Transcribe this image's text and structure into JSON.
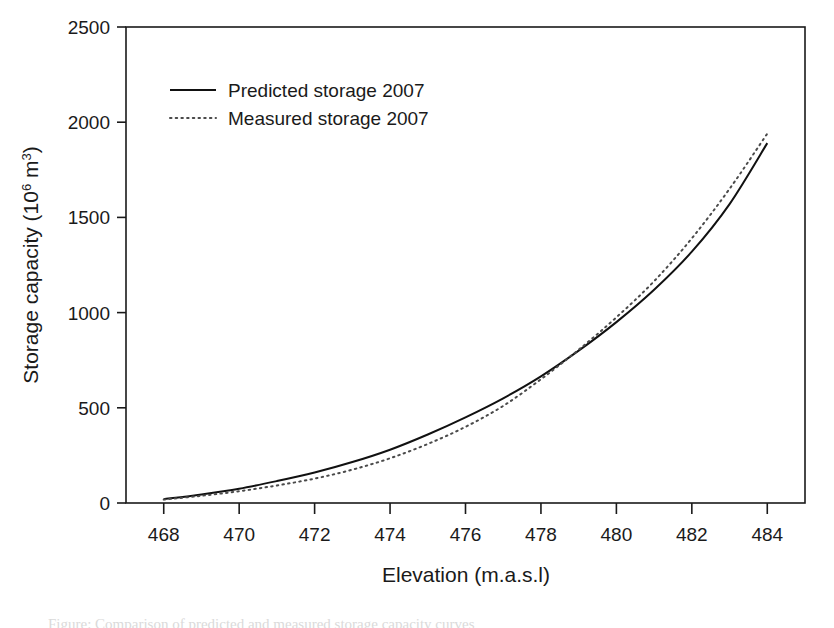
{
  "figure": {
    "background": "#ffffff",
    "ink_color": "#1a1a1a",
    "caption_partial": "Figure: Comparison of predicted and measured storage capacity curves"
  },
  "chart_data": {
    "type": "line",
    "title": "",
    "xlabel": "Elevation (m.a.s.l)",
    "ylabel": "Storage capacity (10⁶ m³)",
    "ylabel_parts": {
      "main": "Storage capacity (10",
      "sup1": "6",
      "mid": " m",
      "sup2": "3",
      "close": ")"
    },
    "xlim": [
      467.0,
      485.0
    ],
    "ylim": [
      0,
      2500
    ],
    "xticks": [
      468,
      470,
      472,
      474,
      476,
      478,
      480,
      482,
      484
    ],
    "yticks": [
      0,
      500,
      1000,
      1500,
      2000,
      2500
    ],
    "grid": false,
    "legend_position": "upper-left-inside",
    "x": [
      468,
      469,
      470,
      471,
      472,
      473,
      474,
      475,
      476,
      477,
      478,
      479,
      480,
      481,
      482,
      483,
      484
    ],
    "series": [
      {
        "name": "Predicted storage 2007",
        "style": "solid",
        "color": "#111111",
        "values": [
          20,
          45,
          75,
          115,
          160,
          215,
          280,
          360,
          450,
          550,
          665,
          800,
          950,
          1120,
          1320,
          1570,
          1890
        ]
      },
      {
        "name": "Measured storage 2007",
        "style": "dotted",
        "color": "#4a4a4a",
        "values": [
          18,
          38,
          62,
          92,
          128,
          175,
          235,
          310,
          400,
          510,
          650,
          805,
          975,
          1165,
          1390,
          1650,
          1940
        ]
      }
    ]
  },
  "legend": {
    "entries": [
      {
        "label": "Predicted storage 2007",
        "style": "solid"
      },
      {
        "label": "Measured storage 2007",
        "style": "dotted"
      }
    ]
  },
  "axis": {
    "x_tick_labels": [
      "468",
      "470",
      "472",
      "474",
      "476",
      "478",
      "480",
      "482",
      "484"
    ],
    "y_tick_labels": [
      "0",
      "500",
      "1000",
      "1500",
      "2000",
      "2500"
    ]
  }
}
